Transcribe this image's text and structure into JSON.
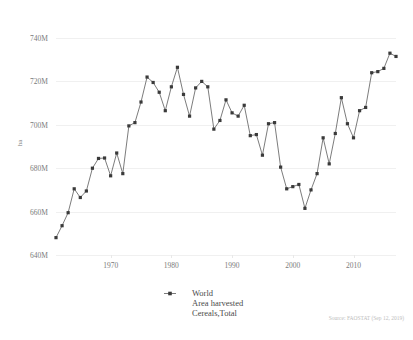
{
  "chart_data": {
    "type": "line",
    "title": "",
    "xlabel": "",
    "ylabel": "ha",
    "xlim": [
      1961,
      2017
    ],
    "ylim": [
      640000000,
      740000000
    ],
    "grid": true,
    "legend_position": "bottom-center",
    "yticks": [
      "640M",
      "660M",
      "680M",
      "700M",
      "720M",
      "740M"
    ],
    "ytick_values": [
      640000000,
      660000000,
      680000000,
      700000000,
      720000000,
      740000000
    ],
    "xticks": [
      "1970",
      "1980",
      "1990",
      "2000",
      "2010"
    ],
    "xtick_values": [
      1970,
      1980,
      1990,
      2000,
      2010
    ],
    "marker": "square",
    "line_color": "#5a5a5a",
    "marker_color": "#3a3a3a",
    "grid_color": "#f0f0f0",
    "series": [
      {
        "name": "World",
        "measure": "Area harvested",
        "item": "Cereals,Total",
        "x": [
          1961,
          1962,
          1963,
          1964,
          1965,
          1966,
          1967,
          1968,
          1969,
          1970,
          1971,
          1972,
          1973,
          1974,
          1975,
          1976,
          1977,
          1978,
          1979,
          1980,
          1981,
          1982,
          1983,
          1984,
          1985,
          1986,
          1987,
          1988,
          1989,
          1990,
          1991,
          1992,
          1993,
          1994,
          1995,
          1996,
          1997,
          1998,
          1999,
          2000,
          2001,
          2002,
          2003,
          2004,
          2005,
          2006,
          2007,
          2008,
          2009,
          2010,
          2011,
          2012,
          2013,
          2014,
          2015,
          2016,
          2017
        ],
        "values": [
          648.0,
          653.5,
          659.5,
          670.5,
          666.5,
          669.5,
          680.0,
          684.5,
          684.7,
          676.5,
          687.0,
          677.5,
          699.5,
          701.0,
          710.5,
          722.0,
          719.5,
          715.0,
          706.5,
          717.5,
          726.5,
          714.0,
          704.0,
          717.0,
          720.0,
          717.5,
          698.0,
          702.0,
          711.5,
          705.5,
          704.0,
          709.0,
          695.0,
          695.5,
          686.0,
          700.5,
          701.0,
          680.5,
          670.5,
          671.5,
          672.5,
          661.5,
          670.0,
          677.5,
          694.0,
          682.0,
          696.0,
          712.5,
          700.5,
          694.0,
          706.5,
          708.0,
          724.0,
          724.5,
          726.0,
          733.0,
          731.5
        ],
        "units": "million ha"
      }
    ],
    "legend_entries": [
      "World",
      "Area harvested",
      "Cereals,Total"
    ],
    "source_note": "Source: FAOSTAT (Sep 12, 2019)"
  },
  "axis": {
    "y_title": "ha"
  },
  "legend": {
    "line1": "World",
    "line2": "Area harvested",
    "line3": "Cereals,Total"
  },
  "footer": {
    "source": "Source: FAOSTAT (Sep 12, 2019)"
  }
}
